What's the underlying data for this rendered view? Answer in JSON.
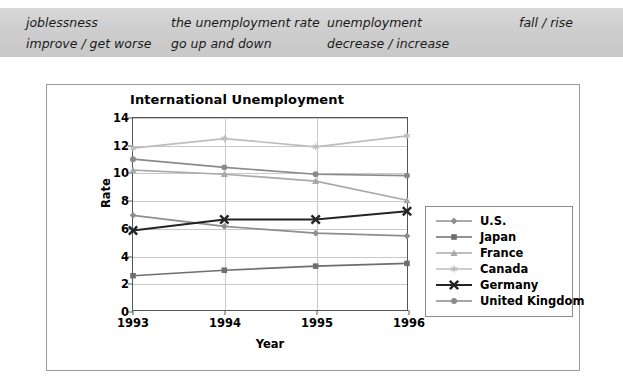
{
  "vocab_band": {
    "columns": [
      {
        "lines": [
          "joblessness",
          "improve / get worse"
        ]
      },
      {
        "lines": [
          "the unemployment rate",
          "go up and down"
        ]
      },
      {
        "lines": [
          "unemployment",
          "decrease / increase"
        ]
      },
      {
        "lines": [
          "",
          "fall / rise"
        ]
      }
    ]
  },
  "chart_data": {
    "type": "line",
    "title": "International Unemployment",
    "xlabel": "Year",
    "ylabel": "Rate",
    "categories": [
      "1993",
      "1994",
      "1995",
      "1996"
    ],
    "x_tick_labels": [
      "1993",
      "1994",
      "1995",
      "1996"
    ],
    "y_tick_labels": [
      "0",
      "2",
      "4",
      "6",
      "8",
      "10",
      "12",
      "14"
    ],
    "y_ticks": [
      0,
      2,
      4,
      6,
      8,
      10,
      12,
      14
    ],
    "ylim": [
      0,
      14
    ],
    "grid": "horizontal-and-vertical",
    "legend_position": "right",
    "series": [
      {
        "name": "U.S.",
        "values": [
          6.9,
          6.1,
          5.6,
          5.4
        ],
        "marker": "diamond",
        "color": "#8e8e8e"
      },
      {
        "name": "Japan",
        "values": [
          2.5,
          2.9,
          3.2,
          3.4
        ],
        "marker": "square",
        "color": "#6e6e6e"
      },
      {
        "name": "France",
        "values": [
          10.2,
          9.9,
          9.4,
          8.0
        ],
        "marker": "triangle",
        "color": "#a9a9a9"
      },
      {
        "name": "Canada",
        "values": [
          11.8,
          12.5,
          11.9,
          12.7
        ],
        "marker": "star",
        "color": "#bdbdbd"
      },
      {
        "name": "Germany",
        "values": [
          5.8,
          6.6,
          6.6,
          7.2
        ],
        "marker": "cross",
        "color": "#242424"
      },
      {
        "name": "United Kingdom",
        "values": [
          11.0,
          10.4,
          9.9,
          9.8
        ],
        "marker": "circle",
        "color": "#8a8a8a"
      }
    ]
  }
}
